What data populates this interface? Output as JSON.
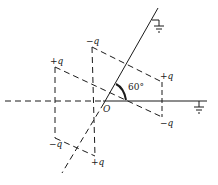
{
  "diagram": {
    "angle_label": "60°",
    "origin_label": "O",
    "charges": [
      {
        "id": "top-middle",
        "label": "−q"
      },
      {
        "id": "left-upper",
        "label": "+q"
      },
      {
        "id": "right-upper",
        "label": "+q"
      },
      {
        "id": "right-lower",
        "label": "−q"
      },
      {
        "id": "left-lower",
        "label": "−q"
      },
      {
        "id": "bottom-middle",
        "label": "+q"
      }
    ],
    "grounds": [
      {
        "id": "ground-top",
        "on": "slanted-conductor"
      },
      {
        "id": "ground-right",
        "on": "horizontal-conductor"
      }
    ],
    "colors": {
      "line": "#1a1a1a",
      "background": "#ffffff"
    }
  }
}
